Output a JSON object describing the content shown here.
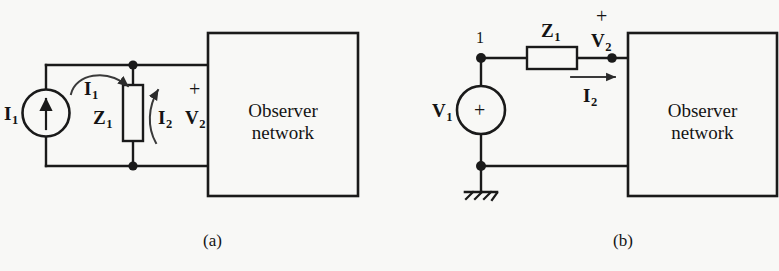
{
  "figure": {
    "type": "circuit-diagram",
    "background_color": "#f8f8f6",
    "ink_color": "#1a1a1a",
    "panels": [
      {
        "id": "a",
        "caption": "(a)",
        "description": "Norton-style current source I1 in parallel with impedance Z1 feeding an observer network; port voltage V2 with current I2.",
        "source_type": "current-source",
        "box_label_line1": "Observer",
        "box_label_line2": "network",
        "labels": {
          "source": "I",
          "source_sub": "1",
          "mesh_current": "I",
          "mesh_current_sub": "1",
          "impedance": "Z",
          "impedance_sub": "1",
          "port_current": "I",
          "port_current_sub": "2",
          "port_voltage": "V",
          "port_voltage_sub": "2",
          "polarity": "+"
        }
      },
      {
        "id": "b",
        "caption": "(b)",
        "description": "Thevenin-style voltage source V1 in series with impedance Z1 feeding an observer network; node 1 at source top, port voltage V2 with current I2, grounded return.",
        "source_type": "voltage-source",
        "box_label_line1": "Observer",
        "box_label_line2": "network",
        "labels": {
          "source": "V",
          "source_sub": "1",
          "source_polarity": "+",
          "node_number": "1",
          "impedance": "Z",
          "impedance_sub": "1",
          "port_current": "I",
          "port_current_sub": "2",
          "port_voltage": "V",
          "port_voltage_sub": "2",
          "polarity": "+",
          "ground": "ground-symbol"
        }
      }
    ]
  }
}
